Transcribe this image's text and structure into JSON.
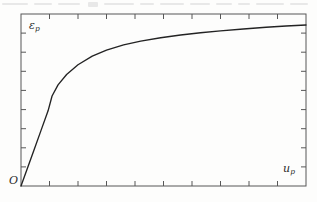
{
  "figure": {
    "background_color": "#fdfdfc",
    "line_color": "#232323",
    "frame_color": "#555555"
  },
  "labels": {
    "y_axis_symbol": "ε",
    "y_axis_subscript": "p",
    "x_axis_symbol": "u",
    "x_axis_subscript": "p",
    "origin": "O"
  },
  "chart_data": {
    "type": "line",
    "title": "",
    "subtitle": "",
    "xlabel": "u_p",
    "ylabel": "ε_p",
    "xlim": [
      0,
      1
    ],
    "ylim": [
      0,
      1
    ],
    "grid": false,
    "legend": null,
    "annotations": [
      {
        "text": "O",
        "position": "origin",
        "role": "origin-marker"
      },
      {
        "text": "ε_p",
        "position": "top-left-inside",
        "role": "y-axis-label"
      },
      {
        "text": "u_p",
        "position": "bottom-right-inside",
        "role": "x-axis-label"
      }
    ],
    "axes": {
      "x_tick_count_interior": 9,
      "y_tick_count_interior": 8,
      "tick_direction": "inward",
      "tick_labels_x": [],
      "tick_labels_y": [],
      "spines": [
        "left",
        "right",
        "top",
        "bottom"
      ]
    },
    "series": [
      {
        "name": "plastic strain vs plastic displacement",
        "x": [
          0.0,
          0.02,
          0.045,
          0.07,
          0.095,
          0.109,
          0.13,
          0.16,
          0.2,
          0.25,
          0.3,
          0.36,
          0.42,
          0.49,
          0.56,
          0.63,
          0.7,
          0.78,
          0.86,
          0.93,
          1.0
        ],
        "y": [
          0.0,
          0.092,
          0.207,
          0.322,
          0.437,
          0.523,
          0.588,
          0.648,
          0.705,
          0.755,
          0.79,
          0.82,
          0.842,
          0.862,
          0.878,
          0.891,
          0.902,
          0.913,
          0.923,
          0.93,
          0.936
        ],
        "kink_at": {
          "x": 0.109,
          "y": 0.523
        }
      }
    ]
  }
}
